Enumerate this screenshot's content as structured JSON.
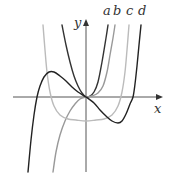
{
  "figure": {
    "axes": {
      "x_label": "x",
      "y_label": "y",
      "origin_px": [
        86,
        97
      ],
      "x_axis_px": [
        13,
        160
      ],
      "y_axis_px": [
        172,
        20
      ],
      "color": "#555555"
    },
    "curves": [
      {
        "label": "a",
        "color": "#333333",
        "width": 1.4,
        "label_pos": [
          103,
          15
        ],
        "points": [
          [
            62,
            25
          ],
          [
            66,
            45
          ],
          [
            70,
            62
          ],
          [
            74,
            76
          ],
          [
            78,
            86
          ],
          [
            82,
            93
          ],
          [
            86,
            97
          ],
          [
            90,
            96
          ],
          [
            94,
            92
          ],
          [
            98,
            82
          ],
          [
            102,
            62
          ],
          [
            106,
            38
          ],
          [
            108,
            25
          ]
        ]
      },
      {
        "label": "b",
        "color": "#999999",
        "width": 1.3,
        "label_pos": [
          113,
          15
        ],
        "points": [
          [
            53,
            172
          ],
          [
            56,
            152
          ],
          [
            60,
            135
          ],
          [
            65,
            121
          ],
          [
            70,
            111
          ],
          [
            75,
            104
          ],
          [
            80,
            99
          ],
          [
            86,
            97
          ],
          [
            92,
            96
          ],
          [
            98,
            93
          ],
          [
            103,
            86
          ],
          [
            107,
            72
          ],
          [
            110,
            55
          ],
          [
            113,
            38
          ],
          [
            115,
            25
          ]
        ]
      },
      {
        "label": "c",
        "color": "#bbbbbb",
        "width": 1.3,
        "label_pos": [
          126,
          15
        ],
        "points": [
          [
            43,
            25
          ],
          [
            45,
            50
          ],
          [
            47,
            72
          ],
          [
            50,
            92
          ],
          [
            54,
            106
          ],
          [
            60,
            115
          ],
          [
            68,
            119
          ],
          [
            76,
            120
          ],
          [
            86,
            121
          ],
          [
            96,
            120
          ],
          [
            104,
            119
          ],
          [
            112,
            115
          ],
          [
            118,
            106
          ],
          [
            122,
            92
          ],
          [
            125,
            72
          ],
          [
            127,
            50
          ],
          [
            129,
            25
          ]
        ]
      },
      {
        "label": "d",
        "color": "#222222",
        "width": 1.6,
        "label_pos": [
          138,
          15
        ],
        "points": [
          [
            28,
            172
          ],
          [
            31,
            140
          ],
          [
            34,
            115
          ],
          [
            37,
            97
          ],
          [
            40,
            86
          ],
          [
            44,
            77
          ],
          [
            49,
            72
          ],
          [
            54,
            72
          ],
          [
            60,
            76
          ],
          [
            66,
            81
          ],
          [
            72,
            87
          ],
          [
            78,
            92
          ],
          [
            86,
            97
          ],
          [
            94,
            103
          ],
          [
            100,
            110
          ],
          [
            106,
            116
          ],
          [
            112,
            121
          ],
          [
            118,
            123
          ],
          [
            122,
            121
          ],
          [
            126,
            114
          ],
          [
            130,
            104
          ],
          [
            133,
            97
          ],
          [
            135,
            84
          ],
          [
            137,
            66
          ],
          [
            139,
            45
          ],
          [
            141,
            25
          ]
        ]
      }
    ]
  }
}
